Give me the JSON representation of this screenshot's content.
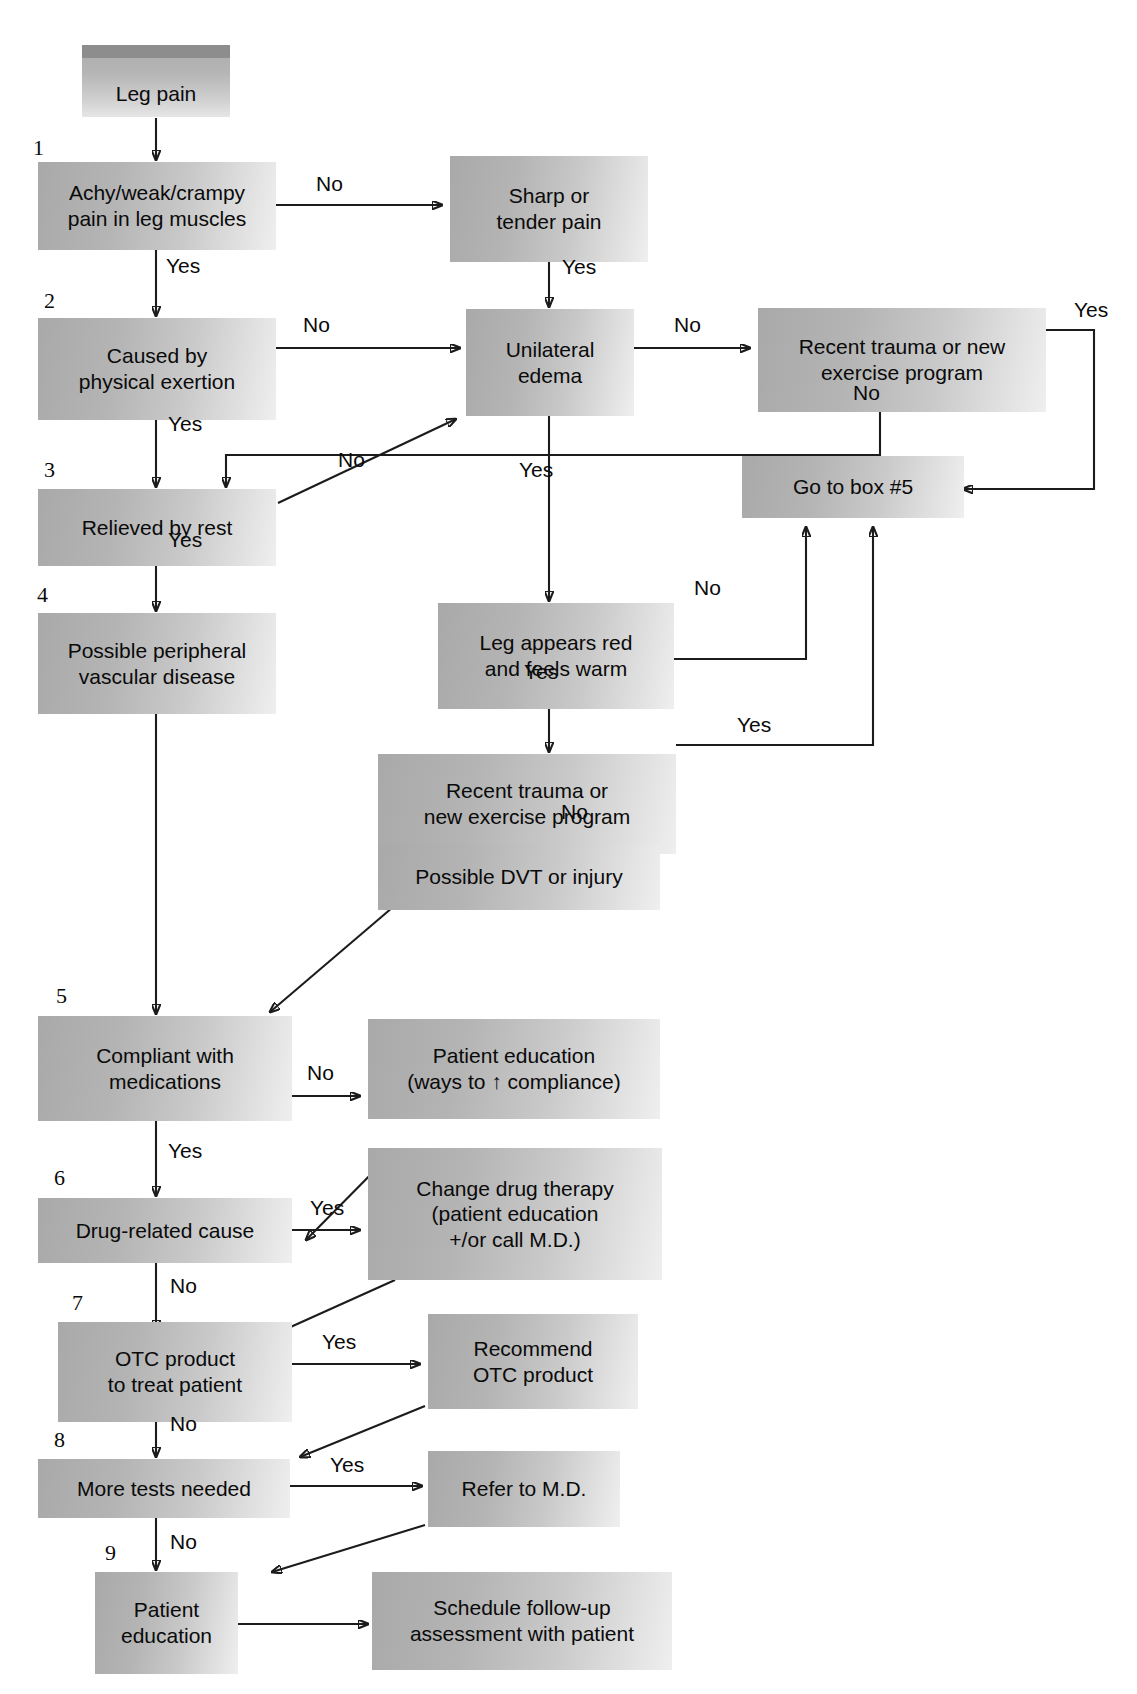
{
  "diagram": {
    "accent_box_fill": "#b4b4b4",
    "accent_box_cap": "#8d8d8d",
    "line_color": "#1c1c1c"
  },
  "nodes": {
    "start": {
      "label": "Leg pain"
    },
    "achy": {
      "label_line1": "Achy/weak/crampy",
      "label_line2": "pain in leg muscles"
    },
    "sharp": {
      "label_line1": "Sharp or",
      "label_line2": "tender pain"
    },
    "exertion": {
      "label_line1": "Caused by",
      "label_line2": "physical exertion"
    },
    "edema": {
      "label_line1": "Unilateral",
      "label_line2": "edema"
    },
    "trauma_top": {
      "label_line1": "Recent trauma or new",
      "label_line2": "exercise program"
    },
    "goto5": {
      "label": "Go to box #5"
    },
    "rest": {
      "label": "Relieved by rest"
    },
    "pvd": {
      "label_line1": "Possible peripheral",
      "label_line2": "vascular disease"
    },
    "red_warm": {
      "label_line1": "Leg appears red",
      "label_line2": "and feels warm"
    },
    "trauma_low": {
      "label_line1": "Recent trauma or",
      "label_line2": "new exercise program"
    },
    "dvt": {
      "label": "Possible DVT or injury"
    },
    "compliant": {
      "label_line1": "Compliant with",
      "label_line2": "medications"
    },
    "pt_edu_compl": {
      "label_line1": "Patient education",
      "label_line2": "(ways to ↑ compliance)"
    },
    "drug_cause": {
      "label": "Drug-related cause"
    },
    "change_drug": {
      "label_line1": "Change drug therapy",
      "label_line2": "(patient education",
      "label_line3": "+/or call M.D.)"
    },
    "otc": {
      "label_line1": "OTC product",
      "label_line2": "to treat patient"
    },
    "recommend_otc": {
      "label_line1": "Recommend",
      "label_line2": "OTC product"
    },
    "more_tests": {
      "label": "More tests needed"
    },
    "refer_md": {
      "label": "Refer to M.D."
    },
    "pt_edu": {
      "label_line1": "Patient",
      "label_line2": "education"
    },
    "schedule": {
      "label_line1": "Schedule follow-up",
      "label_line2": "assessment with patient"
    }
  },
  "step_numbers": [
    {
      "id": "n1",
      "label": "1"
    },
    {
      "id": "n2",
      "label": "2"
    },
    {
      "id": "n3",
      "label": "3"
    },
    {
      "id": "n4",
      "label": "4"
    },
    {
      "id": "n5",
      "label": "5"
    },
    {
      "id": "n6",
      "label": "6"
    },
    {
      "id": "n7",
      "label": "7"
    },
    {
      "id": "n8",
      "label": "8"
    },
    {
      "id": "n9",
      "label": "9"
    }
  ],
  "edge_labels": [
    {
      "id": "e_achy_no",
      "label": "No"
    },
    {
      "id": "e_achy_yes",
      "label": "Yes"
    },
    {
      "id": "e_sharp_yes",
      "label": "Yes"
    },
    {
      "id": "e_exertion_no",
      "label": "No"
    },
    {
      "id": "e_edema_no",
      "label": "No"
    },
    {
      "id": "e_traumatop_yes",
      "label": "Yes"
    },
    {
      "id": "e_traumatop_no",
      "label": "No"
    },
    {
      "id": "e_exertion_yes",
      "label": "Yes"
    },
    {
      "id": "e_rest_no",
      "label": "No"
    },
    {
      "id": "e_edema_yes",
      "label": "Yes"
    },
    {
      "id": "e_rest_yes",
      "label": "Yes"
    },
    {
      "id": "e_redwarm_no",
      "label": "No"
    },
    {
      "id": "e_redwarm_yes",
      "label": "Yes"
    },
    {
      "id": "e_traumalow_yes",
      "label": "Yes"
    },
    {
      "id": "e_traumalow_no",
      "label": "No"
    },
    {
      "id": "e_compl_no",
      "label": "No"
    },
    {
      "id": "e_compl_yes",
      "label": "Yes"
    },
    {
      "id": "e_drug_yes",
      "label": "Yes"
    },
    {
      "id": "e_drug_no",
      "label": "No"
    },
    {
      "id": "e_otc_yes",
      "label": "Yes"
    },
    {
      "id": "e_otc_no",
      "label": "No"
    },
    {
      "id": "e_tests_yes",
      "label": "Yes"
    },
    {
      "id": "e_tests_no",
      "label": "No"
    }
  ]
}
